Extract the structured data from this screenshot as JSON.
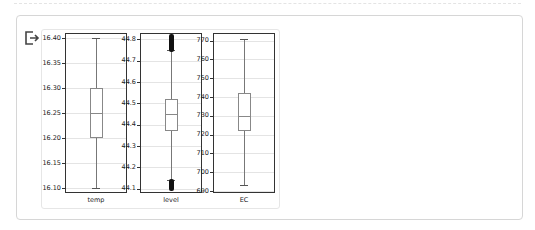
{
  "cell": {
    "output_icon": "output-arrow-icon"
  },
  "colors": {
    "box": "#888888",
    "whisker": "#777777",
    "outlier": "#111111",
    "grid": "#e4e4e4",
    "frame": "#333333"
  },
  "chart_data": [
    {
      "type": "box",
      "xlabel": "temp",
      "yticks": [
        "16.40",
        "16.35",
        "16.30",
        "16.25",
        "16.20",
        "16.15",
        "16.10"
      ],
      "ylim": [
        16.09,
        16.41
      ],
      "grid": true,
      "stats": {
        "whisker_low": 16.1,
        "q1": 16.2,
        "median": 16.25,
        "q3": 16.3,
        "whisker_high": 16.4
      },
      "outliers": []
    },
    {
      "type": "box",
      "xlabel": "level",
      "yticks": [
        "44.8",
        "44.7",
        "44.6",
        "44.5",
        "44.4",
        "44.3",
        "44.2",
        "44.1"
      ],
      "ylim": [
        44.08,
        44.83
      ],
      "grid": true,
      "stats": {
        "whisker_low": 44.14,
        "q1": 44.37,
        "median": 44.45,
        "q3": 44.52,
        "whisker_high": 44.75
      },
      "outliers": {
        "low_range": [
          44.1,
          44.14
        ],
        "high_range": [
          44.75,
          44.82
        ]
      }
    },
    {
      "type": "box",
      "xlabel": "EC",
      "yticks": [
        "770",
        "760",
        "750",
        "740",
        "730",
        "720",
        "710",
        "700",
        "690"
      ],
      "ylim": [
        689,
        774
      ],
      "grid": true,
      "stats": {
        "whisker_low": 693,
        "q1": 722,
        "median": 730,
        "q3": 742,
        "whisker_high": 771
      },
      "outliers": []
    }
  ]
}
